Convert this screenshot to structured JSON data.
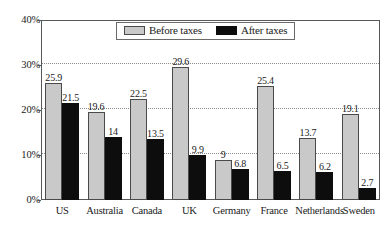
{
  "chart_data": {
    "type": "bar",
    "title": "",
    "subtitle": "",
    "xlabel": "",
    "ylabel": "",
    "ylim": [
      0,
      40
    ],
    "yticks": [
      "0%",
      "10%",
      "20%",
      "30%",
      "40%"
    ],
    "ytick_values": [
      0,
      10,
      20,
      30,
      40
    ],
    "grid": "horizontal-dotted",
    "legend_position": "top-center",
    "categories": [
      "US",
      "Australia",
      "Canada",
      "UK",
      "Germany",
      "France",
      "Netherlands",
      "Sweden"
    ],
    "series": [
      {
        "name": "Before taxes",
        "color": "#c9c9c9",
        "values": [
          25.9,
          19.6,
          22.5,
          29.6,
          9,
          25.4,
          13.7,
          19.1
        ],
        "labels": [
          "25.9",
          "19.6",
          "22.5",
          "29.6",
          "9",
          "25.4",
          "13.7",
          "19.1"
        ]
      },
      {
        "name": "After taxes",
        "color": "#0d0d0d",
        "values": [
          21.5,
          14,
          13.5,
          9.9,
          6.8,
          6.5,
          6.2,
          2.7
        ],
        "labels": [
          "21.5",
          "14",
          "13.5",
          "9.9",
          "6.8",
          "6.5",
          "6.2",
          "2.7"
        ]
      }
    ]
  },
  "legend": {
    "items": [
      {
        "label": "Before taxes",
        "swatch": "light-gray"
      },
      {
        "label": "After taxes",
        "swatch": "black"
      }
    ]
  }
}
